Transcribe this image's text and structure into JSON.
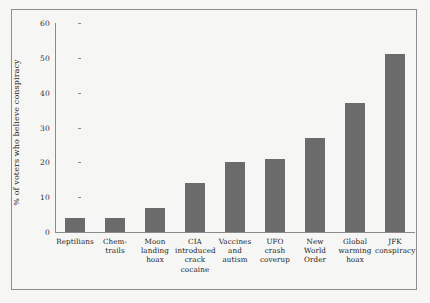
{
  "chart_data": {
    "type": "bar",
    "title": "",
    "xlabel": "",
    "ylabel": "% of voters who believe conspiracy",
    "ylim": [
      0,
      60
    ],
    "yticks": [
      0,
      10,
      20,
      30,
      40,
      50,
      60
    ],
    "grid": false,
    "legend": false,
    "bar_color": "#6b6b6b",
    "categories": [
      "Reptilians",
      "Chem-\ntrails",
      "Moon\nlanding\nhoax",
      "CIA\nintroduced\ncrack\ncocaine",
      "Vaccines\nand\nautism",
      "UFO\ncrash\ncoverup",
      "New\nWorld\nOrder",
      "Global\nwarming\nhoax",
      "JFK\nconspiracy"
    ],
    "values": [
      4,
      4,
      7,
      14,
      20,
      21,
      27,
      37,
      51
    ]
  },
  "figure": {
    "background_color": "#f6f6f4",
    "border_color": "#8e8e8e",
    "axis_color": "#8a8a8a"
  }
}
